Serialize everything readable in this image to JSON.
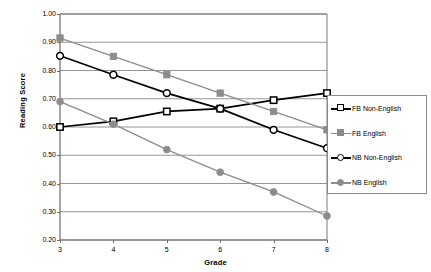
{
  "chart_data": {
    "type": "line",
    "title": "",
    "xlabel": "Grade",
    "ylabel": "Reading Score",
    "categories": [
      3,
      4,
      5,
      6,
      7,
      8
    ],
    "xticklabels": [
      "3",
      "4",
      "5",
      "6",
      "7",
      "8"
    ],
    "yticklabels": [
      "1.00",
      "0.90",
      "0.80",
      "0.70",
      "0.60",
      "0.50",
      "0.40",
      "0.30",
      "0.20"
    ],
    "ytickvalues": [
      1.0,
      0.9,
      0.8,
      0.7,
      0.6,
      0.5,
      0.4,
      0.3,
      0.2
    ],
    "ylim": [
      0.2,
      1.0
    ],
    "xlim": [
      3,
      8
    ],
    "grid": "horizontal",
    "legend_position": "right",
    "series": [
      {
        "name": "FB Non-English",
        "color": "#000000",
        "marker": "open-square",
        "values": [
          0.6,
          0.62,
          0.655,
          0.665,
          0.695,
          0.72
        ]
      },
      {
        "name": "FB English",
        "color": "#8c8c8c",
        "marker": "filled-square",
        "values": [
          0.915,
          0.85,
          0.785,
          0.72,
          0.655,
          0.59
        ]
      },
      {
        "name": "NB Non-English",
        "color": "#000000",
        "marker": "open-circle",
        "values": [
          0.852,
          0.785,
          0.72,
          0.665,
          0.59,
          0.525
        ]
      },
      {
        "name": "NB English",
        "color": "#8c8c8c",
        "marker": "filled-circle",
        "values": [
          0.69,
          0.61,
          0.52,
          0.44,
          0.37,
          0.285
        ]
      }
    ]
  },
  "legend": {
    "items": [
      {
        "label": "FB Non-English"
      },
      {
        "label": "FB English"
      },
      {
        "label": "NB Non-English"
      },
      {
        "label": "NB English"
      }
    ]
  },
  "colors": {
    "axis": "#6d6d6d",
    "gridline": "#8a8a8a",
    "dark_series": "#000000",
    "light_series": "#8c8c8c",
    "background": "#ffffff"
  }
}
